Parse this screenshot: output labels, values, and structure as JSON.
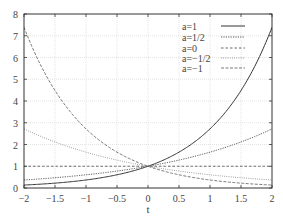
{
  "chart_data": {
    "type": "line",
    "title": "",
    "xlabel": "t",
    "ylabel": "",
    "xlim": [
      -2,
      2
    ],
    "ylim": [
      0,
      8
    ],
    "grid": true,
    "legend_position": "top-right",
    "x_ticks": [
      "-2",
      "-1.5",
      "-1",
      "-0.5",
      "0",
      "0.5",
      "1",
      "1.5",
      "2"
    ],
    "y_ticks": [
      "0",
      "1",
      "2",
      "3",
      "4",
      "5",
      "6",
      "7",
      "8"
    ],
    "function": "exp(a*t)",
    "x": [
      -2,
      -1.5,
      -1,
      -0.5,
      0,
      0.5,
      1,
      1.5,
      2
    ],
    "series": [
      {
        "name": "a=1",
        "a": 1,
        "style": "solid",
        "values": [
          0.135,
          0.223,
          0.368,
          0.607,
          1,
          1.649,
          2.718,
          4.482,
          7.389
        ]
      },
      {
        "name": "a=1/2",
        "a": 0.5,
        "style": "dotted",
        "values": [
          0.368,
          0.472,
          0.607,
          0.779,
          1,
          1.284,
          1.649,
          2.117,
          2.718
        ]
      },
      {
        "name": "a=0",
        "a": 0,
        "style": "dashed",
        "values": [
          1,
          1,
          1,
          1,
          1,
          1,
          1,
          1,
          1
        ]
      },
      {
        "name": "a=−1/2",
        "a": -0.5,
        "style": "dotted-light",
        "values": [
          2.718,
          2.117,
          1.649,
          1.284,
          1,
          0.779,
          0.607,
          0.472,
          0.368
        ]
      },
      {
        "name": "a=−1",
        "a": -1,
        "style": "dash-dot",
        "values": [
          7.389,
          4.482,
          2.718,
          1.649,
          1,
          0.607,
          0.368,
          0.223,
          0.135
        ]
      }
    ]
  },
  "legend": {
    "items": [
      {
        "label": "a=1"
      },
      {
        "label": "a=1/2"
      },
      {
        "label": "a=0"
      },
      {
        "label": "a=−1/2"
      },
      {
        "label": "a=−1"
      }
    ]
  },
  "axes": {
    "xlabel": "t",
    "x_ticks": [
      "−2",
      "−1.5",
      "−1",
      "−0.5",
      "0",
      "0.5",
      "1",
      "1.5",
      "2"
    ],
    "y_ticks": [
      "0",
      "1",
      "2",
      "3",
      "4",
      "5",
      "6",
      "7",
      "8"
    ]
  },
  "colors": {
    "axis": "#333333",
    "grid": "#dddddd",
    "series": [
      "#333333",
      "#555555",
      "#555555",
      "#888888",
      "#666666"
    ]
  }
}
